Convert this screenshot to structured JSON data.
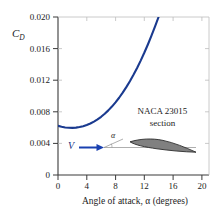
{
  "chart_data": {
    "type": "line",
    "title": "",
    "xlabel": "Angle of attack, α (degrees)",
    "ylabel": "C_D",
    "ylabel_main": "C",
    "ylabel_sub": "D",
    "xlim": [
      0,
      21
    ],
    "ylim": [
      0,
      0.02
    ],
    "xticks": [
      0,
      4,
      8,
      12,
      16,
      20
    ],
    "xtick_labels": [
      "0",
      "4",
      "8",
      "12",
      "16",
      "20"
    ],
    "yticks": [
      0,
      0.004,
      0.008,
      0.012,
      0.016,
      0.02
    ],
    "ytick_labels": [
      "0",
      "0.004",
      "0.008",
      "0.012",
      "0.016",
      "0.020"
    ],
    "grid": false,
    "legend": "none",
    "series": [
      {
        "name": "NACA 23015 drag coefficient",
        "color": "#1a3a8f",
        "x": [
          0.0,
          0.5,
          1.0,
          1.5,
          2.0,
          2.5,
          3.0,
          3.5,
          4.0,
          4.5,
          5.0,
          5.5,
          6.0,
          6.5,
          7.0,
          7.5,
          8.0,
          8.5,
          9.0,
          9.5,
          10.0,
          10.5,
          11.0,
          11.5,
          12.0,
          12.5,
          13.0,
          13.5,
          14.0,
          14.5,
          15.0,
          15.5,
          16.0,
          16.3
        ],
        "y": [
          0.00622,
          0.0061,
          0.00602,
          0.00598,
          0.00597,
          0.006,
          0.00607,
          0.00618,
          0.00633,
          0.00652,
          0.00676,
          0.00704,
          0.00737,
          0.00775,
          0.00818,
          0.00866,
          0.00919,
          0.00978,
          0.01042,
          0.01112,
          0.01187,
          0.01268,
          0.01355,
          0.01448,
          0.01547,
          0.01652,
          0.01763,
          0.0188,
          0.02003,
          0.02132,
          0.02267,
          0.02408,
          0.02555,
          0.02646
        ]
      }
    ],
    "annotations": {
      "section_line1": "NACA 23015",
      "section_line2": "section",
      "velocity_symbol": "V",
      "angle_symbol": "α",
      "airfoil_fill": "#808080",
      "airfoil_stroke": "#2b2b2b",
      "arrow_color": "#1940b0",
      "axis_color": "#3a3a3a"
    }
  }
}
